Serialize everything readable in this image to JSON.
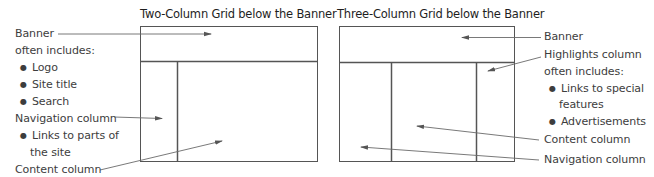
{
  "left_diagram": {
    "title": "Two-Column Grid below the Banner",
    "labels": {
      "banner": "Banner",
      "often_includes": "often includes:",
      "bullets": [
        "Logo",
        "Site title",
        "Search"
      ],
      "navigation": "Navigation column",
      "nav_bullet_line1": "Links to parts of",
      "nav_bullet_line2": "the site",
      "content": "Content column"
    }
  },
  "right_diagram": {
    "title": "Three-Column Grid below the Banner",
    "labels": {
      "banner": "Banner",
      "highlights": "Highlights column",
      "often_includes": "often includes:",
      "bullet1_line1": "Links to special",
      "bullet1_line2": "features",
      "bullet2": "Advertisements",
      "content": "Content column",
      "navigation": "Navigation column"
    }
  },
  "colors": {
    "outline": "#4a4a4a",
    "arrow": "#6a6a6a",
    "text": "#3d3d3d"
  }
}
